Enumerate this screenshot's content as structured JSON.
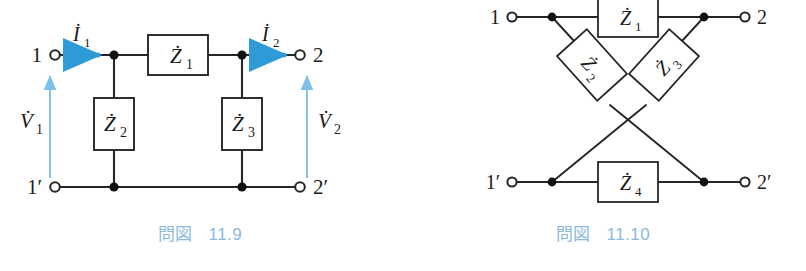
{
  "page": {
    "background": "#ffffff",
    "caption_color": "#8cb9de",
    "wire_color": "#262626",
    "current_arrow_color": "#2e9bd6",
    "voltage_arrow_color": "#7cc0e8"
  },
  "figures": [
    {
      "id": "fig-11-9",
      "caption_jp": "問図",
      "caption_num": "11.9",
      "caption_full": "問図 11.9",
      "type": "two-port-tee-network",
      "terminals": [
        {
          "name": "terminal-1",
          "label": "1",
          "x": 52,
          "y": 55
        },
        {
          "name": "terminal-2",
          "label": "2",
          "x": 303,
          "y": 55
        },
        {
          "name": "terminal-1p",
          "label": "1′",
          "x": 52,
          "y": 187
        },
        {
          "name": "terminal-2p",
          "label": "2′",
          "x": 303,
          "y": 187
        }
      ],
      "components": [
        {
          "name": "impedance-z1",
          "label": "Ż",
          "sub": "1",
          "orientation": "horizontal",
          "cx": 178,
          "cy": 55
        },
        {
          "name": "impedance-z2",
          "label": "Ż",
          "sub": "2",
          "orientation": "vertical",
          "cx": 114,
          "cy": 124
        },
        {
          "name": "impedance-z3",
          "label": "Ż",
          "sub": "3",
          "orientation": "vertical",
          "cx": 242,
          "cy": 124
        }
      ],
      "current_arrows": [
        {
          "name": "current-i1",
          "label": "İ",
          "sub": "1",
          "direction": "right"
        },
        {
          "name": "current-i2",
          "label": "İ",
          "sub": "2",
          "direction": "right"
        }
      ],
      "voltage_arrows": [
        {
          "name": "voltage-v1",
          "label": "V̇",
          "sub": "1",
          "direction": "up"
        },
        {
          "name": "voltage-v2",
          "label": "V̇",
          "sub": "2",
          "direction": "up"
        }
      ]
    },
    {
      "id": "fig-11-10",
      "caption_jp": "問図",
      "caption_num": "11.10",
      "caption_full": "問図 11.10",
      "type": "lattice-bridge-network",
      "terminals": [
        {
          "name": "terminal-1",
          "label": "1",
          "x": 108,
          "y": 17
        },
        {
          "name": "terminal-2",
          "label": "2",
          "x": 348,
          "y": 17
        },
        {
          "name": "terminal-1p",
          "label": "1′",
          "x": 108,
          "y": 182
        },
        {
          "name": "terminal-2p",
          "label": "2′",
          "x": 348,
          "y": 182
        }
      ],
      "components": [
        {
          "name": "impedance-z1",
          "label": "Ż",
          "sub": "1",
          "orientation": "horizontal",
          "cx": 228,
          "cy": 17
        },
        {
          "name": "impedance-z2",
          "label": "Ż",
          "sub": "2",
          "orientation": "diagonal-down-right",
          "cx": 192,
          "cy": 73
        },
        {
          "name": "impedance-z3",
          "label": "Ż",
          "sub": "3",
          "orientation": "diagonal-down-left",
          "cx": 266,
          "cy": 73
        },
        {
          "name": "impedance-z4",
          "label": "Ż",
          "sub": "4",
          "orientation": "horizontal",
          "cx": 228,
          "cy": 182
        }
      ],
      "current_arrows": [],
      "voltage_arrows": []
    }
  ]
}
